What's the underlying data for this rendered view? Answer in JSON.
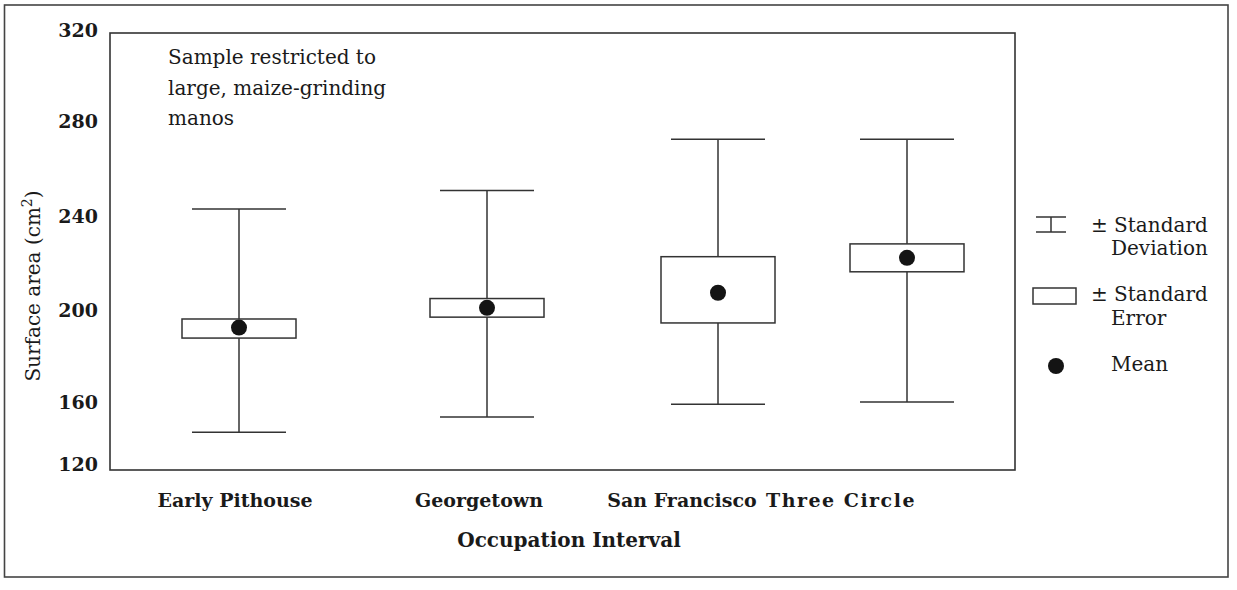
{
  "chart_data": {
    "type": "box",
    "title": "",
    "annotation": [
      "Sample restricted to",
      "large, maize-grinding",
      "manos"
    ],
    "xlabel": "Occupation Interval",
    "ylabel": "Surface area (cm",
    "ylabel_superscript": "2",
    "ylabel_close": ")",
    "yticks": [
      320,
      280,
      240,
      200,
      160,
      120
    ],
    "ylim": [
      120,
      320
    ],
    "grid": false,
    "legend_position": "right",
    "categories": [
      "Early Pithouse",
      "Georgetown",
      "San Francisco",
      "Three Circle"
    ],
    "series": [
      {
        "name": "Mean",
        "values": [
          192,
          200.5,
          207,
          222
        ]
      },
      {
        "name": "SE low",
        "values": [
          187.5,
          196.5,
          194,
          216
        ]
      },
      {
        "name": "SE high",
        "values": [
          195.7,
          204.5,
          222.5,
          228
        ]
      },
      {
        "name": "SD low",
        "values": [
          147,
          153.5,
          159,
          160
        ]
      },
      {
        "name": "SD high",
        "values": [
          243,
          251,
          273,
          273
        ]
      }
    ],
    "legend": [
      {
        "symbol": "sd-bracket",
        "line1": "± Standard",
        "line2": "Deviation"
      },
      {
        "symbol": "se-box",
        "line1": "± Standard",
        "line2": "Error"
      },
      {
        "symbol": "mean-dot",
        "line1": "Mean",
        "line2": ""
      }
    ]
  },
  "colors": {
    "line": "#333333",
    "dot": "#141414",
    "background": "#ffffff"
  }
}
